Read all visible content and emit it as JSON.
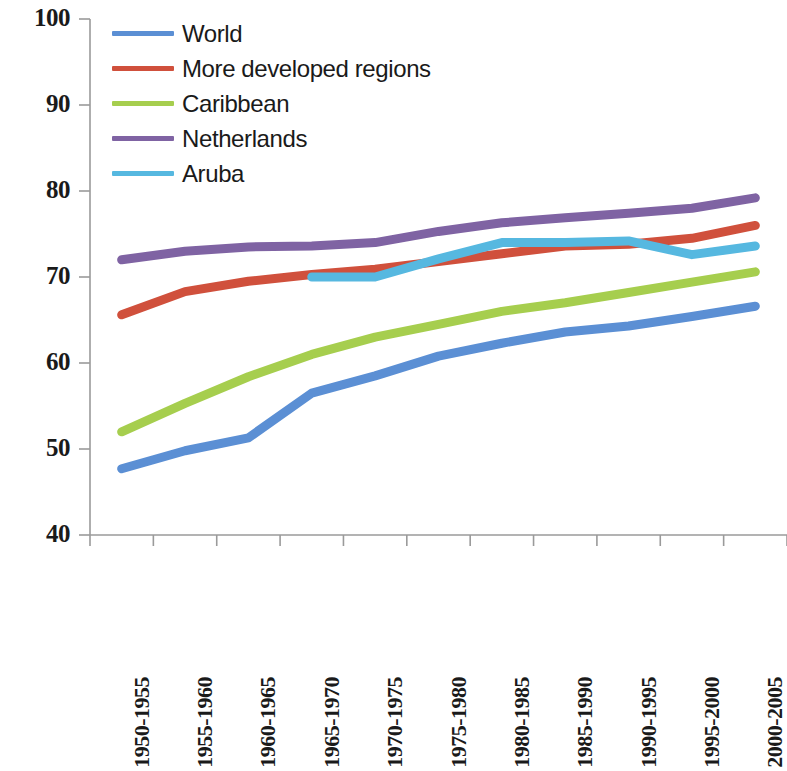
{
  "chart_data": {
    "type": "line",
    "title": "",
    "subtitle": "",
    "xlabel": "",
    "ylabel": "",
    "ylim": [
      40,
      100
    ],
    "yticks": [
      100,
      90,
      80,
      70,
      60,
      50,
      40
    ],
    "grid": false,
    "legend_position": "top-left",
    "categories": [
      "1950-1955",
      "1955-1960",
      "1960-1965",
      "1965-1970",
      "1970-1975",
      "1975-1980",
      "1980-1985",
      "1985-1990",
      "1990-1995",
      "1995-2000",
      "2000-2005"
    ],
    "series": [
      {
        "name": "World",
        "color": "#5B8FD4",
        "values": [
          47.7,
          49.8,
          51.3,
          56.5,
          58.5,
          60.8,
          62.3,
          63.6,
          64.3,
          65.4,
          66.6
        ]
      },
      {
        "name": "More developed regions",
        "color": "#D0503C",
        "values": [
          65.6,
          68.3,
          69.5,
          70.3,
          70.9,
          71.8,
          72.7,
          73.6,
          73.8,
          74.5,
          76.0
        ]
      },
      {
        "name": "Caribbean",
        "color": "#A6CE4E",
        "values": [
          52.0,
          55.3,
          58.4,
          61.0,
          63.0,
          64.5,
          66.0,
          67.0,
          68.2,
          69.4,
          70.6
        ]
      },
      {
        "name": "Netherlands",
        "color": "#7F63A3",
        "values": [
          72.0,
          73.0,
          73.5,
          73.6,
          74.0,
          75.3,
          76.3,
          76.9,
          77.4,
          78.0,
          79.2
        ]
      },
      {
        "name": "Aruba",
        "color": "#56B8E0",
        "values": [
          null,
          null,
          null,
          70.0,
          70.0,
          72.1,
          74.0,
          74.0,
          74.2,
          72.6,
          73.6
        ]
      }
    ]
  },
  "legend": {
    "items": [
      {
        "label": "World",
        "color": "#5B8FD4"
      },
      {
        "label": "More developed regions",
        "color": "#D0503C"
      },
      {
        "label": "Caribbean",
        "color": "#A6CE4E"
      },
      {
        "label": "Netherlands",
        "color": "#7F63A3"
      },
      {
        "label": "Aruba",
        "color": "#56B8E0"
      }
    ]
  },
  "axes": {
    "y_tick_labels": [
      "100",
      "90",
      "80",
      "70",
      "60",
      "50",
      "40"
    ],
    "x_tick_labels": [
      "1950-1955",
      "1955-1960",
      "1960-1965",
      "1965-1970",
      "1970-1975",
      "1975-1980",
      "1980-1985",
      "1985-1990",
      "1990-1995",
      "1995-2000",
      "2000-2005"
    ],
    "axis_color": "#9a9a9a"
  }
}
